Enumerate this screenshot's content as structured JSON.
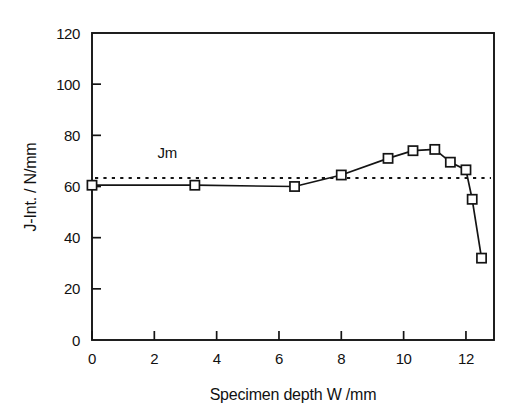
{
  "chart_data": {
    "type": "line",
    "title": "",
    "subtitle": "",
    "xlabel": "Specimen depth W /mm",
    "ylabel": "J-Int. / N/mm",
    "xlim": [
      0,
      12.9
    ],
    "ylim": [
      0,
      120
    ],
    "xticks": [
      0,
      2,
      4,
      6,
      8,
      10,
      12
    ],
    "xticklabels": [
      "0",
      "2",
      "4",
      "6",
      "8",
      "10",
      "12"
    ],
    "yticks": [
      0,
      20,
      40,
      60,
      80,
      100,
      120
    ],
    "yticklabels": [
      "0",
      "20",
      "40",
      "60",
      "80",
      "100",
      "120"
    ],
    "grid": false,
    "legend": false,
    "marker": "open-square",
    "series": [
      {
        "name": "J-Integral",
        "x": [
          0.0,
          3.3,
          6.5,
          8.0,
          9.5,
          10.3,
          11.0,
          11.5,
          12.0,
          12.2,
          12.5
        ],
        "y": [
          60.5,
          60.5,
          60.0,
          64.5,
          71.0,
          74.0,
          74.5,
          69.5,
          66.5,
          55.0,
          32.0
        ]
      }
    ],
    "annotations": [
      {
        "name": "jm-reference-line",
        "label": "Jm",
        "type": "horizontal-line",
        "value": 63.3,
        "style": "dotted",
        "label_x": 2.1,
        "label_y": 71.0
      }
    ]
  },
  "axes": {
    "x_title": "Specimen depth W /mm",
    "y_title": "J-Int. / N/mm"
  },
  "annotation": {
    "jm_label": "Jm"
  }
}
